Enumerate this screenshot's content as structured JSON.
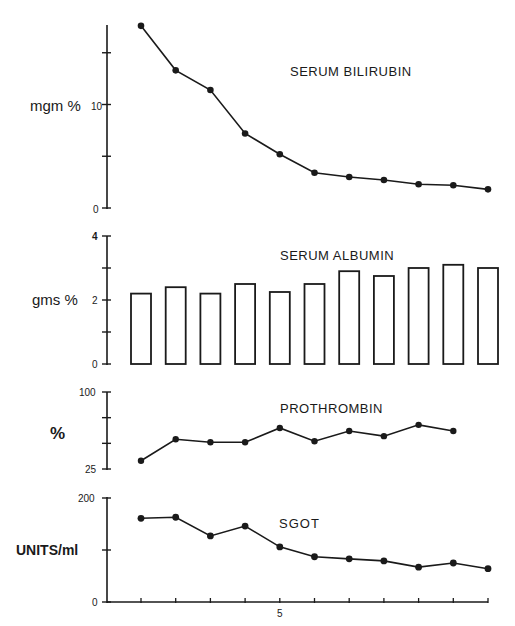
{
  "chart_data": [
    {
      "type": "line",
      "title": "SERUM BILIRUBIN",
      "ylabel": "mgm %",
      "xlabel": "",
      "ylim": [
        0,
        17.7
      ],
      "yticks": [
        0,
        5,
        10,
        15
      ],
      "ytick_labels": [
        "0",
        "",
        "10",
        ""
      ],
      "x": [
        1,
        2,
        3,
        4,
        5,
        6,
        7,
        8,
        9,
        10,
        11
      ],
      "values": [
        17.6,
        13.3,
        11.4,
        7.2,
        5.2,
        3.4,
        3.0,
        2.7,
        2.3,
        2.2,
        1.8
      ],
      "grid": false
    },
    {
      "type": "bar",
      "title": "SERUM ALBUMIN",
      "ylabel": "gms %",
      "xlabel": "",
      "ylim": [
        0,
        4
      ],
      "yticks": [
        0,
        1,
        2,
        3,
        4
      ],
      "ytick_labels": [
        "0",
        "",
        "2",
        "",
        "4"
      ],
      "categories": [
        1,
        2,
        3,
        4,
        5,
        6,
        7,
        8,
        9,
        10,
        11
      ],
      "values": [
        2.2,
        2.4,
        2.2,
        2.5,
        2.25,
        2.5,
        2.9,
        2.75,
        3.0,
        3.1,
        3.0
      ],
      "grid": false
    },
    {
      "type": "line",
      "title": "PROTHROMBIN",
      "ylabel": "%",
      "xlabel": "",
      "ylim": [
        25,
        100
      ],
      "yticks": [
        25,
        50,
        75,
        100
      ],
      "ytick_labels": [
        "25",
        "",
        "",
        "100"
      ],
      "x": [
        1,
        2,
        3,
        4,
        5,
        6,
        7,
        8,
        9,
        10
      ],
      "values": [
        33,
        54,
        51,
        51,
        65,
        52,
        62,
        57,
        68,
        62
      ],
      "grid": false
    },
    {
      "type": "line",
      "title": "SGOT",
      "ylabel": "UNITS/ml",
      "xlabel": "",
      "ylim": [
        0,
        200
      ],
      "yticks": [
        0,
        100,
        200
      ],
      "ytick_labels": [
        "0",
        "",
        "200"
      ],
      "x": [
        1,
        2,
        3,
        4,
        5,
        6,
        7,
        8,
        9,
        10,
        11
      ],
      "values": [
        161,
        163,
        127,
        146,
        106,
        87,
        83,
        79,
        67,
        75,
        64
      ],
      "xticks": [
        1,
        2,
        3,
        4,
        5,
        6,
        7,
        8,
        9,
        10,
        11
      ],
      "xtick_labels": [
        "",
        "",
        "",
        "",
        "5",
        "",
        "",
        "",
        "",
        "",
        ""
      ],
      "grid": false
    }
  ],
  "panels": {
    "bilirubin": {
      "title": "SERUM BILIRUBIN",
      "ylabel": "mgm %",
      "tick_10": "10",
      "tick_0": "0"
    },
    "albumin": {
      "title": "SERUM ALBUMIN",
      "ylabel": "gms %",
      "tick_4": "4",
      "tick_2": "2",
      "tick_0": "0"
    },
    "prothrombin": {
      "title": "PROTHROMBIN",
      "ylabel": "%",
      "tick_100": "100",
      "tick_25": "25"
    },
    "sgot": {
      "title": "SGOT",
      "ylabel": "UNITS/ml",
      "tick_200": "200",
      "tick_0": "0",
      "xtick_5": "5"
    }
  },
  "colors": {
    "ink": "#1a1a1a",
    "background": "#ffffff"
  }
}
